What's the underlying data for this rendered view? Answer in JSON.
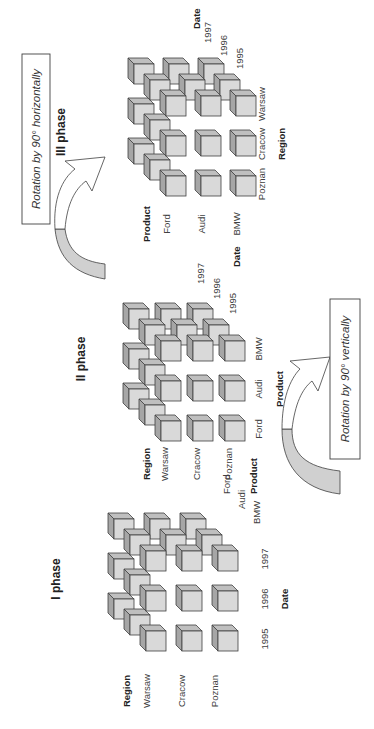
{
  "phases": [
    {
      "title": "I phase",
      "row_axis": "Region",
      "rows": [
        "Warsaw",
        "Cracow",
        "Poznan"
      ],
      "col_axis": "Date",
      "cols": [
        "1995",
        "1996",
        "1997"
      ],
      "depth_axis": "Product",
      "depth": [
        "BMW",
        "Audi",
        "Ford"
      ]
    },
    {
      "title": "II phase",
      "row_axis": "Region",
      "rows": [
        "Warsaw",
        "Cracow",
        "Poznan"
      ],
      "col_axis": "Product",
      "cols": [
        "Ford",
        "Audi",
        "BMW"
      ],
      "depth_axis": "Date",
      "depth": [
        "1995",
        "1996",
        "1997"
      ]
    },
    {
      "title": "III phase",
      "row_axis": "Product",
      "rows": [
        "Ford",
        "Audi",
        "BMW"
      ],
      "col_axis": "Region",
      "cols": [
        "Poznan",
        "Cracow",
        "Warsaw"
      ],
      "depth_axis": "Date",
      "depth": [
        "1995",
        "1996",
        "1997"
      ]
    }
  ],
  "transitions": [
    {
      "caption": "Rotation by 90° vertically"
    },
    {
      "caption": "Rotation by 90° horizontally"
    }
  ],
  "colors": {
    "cube_front": "#d9d9d9",
    "cube_top": "#a6a6a6",
    "cube_side": "#bfbfbf",
    "cube_stroke": "#404040",
    "arrow_fill": "#d0d0d0"
  }
}
